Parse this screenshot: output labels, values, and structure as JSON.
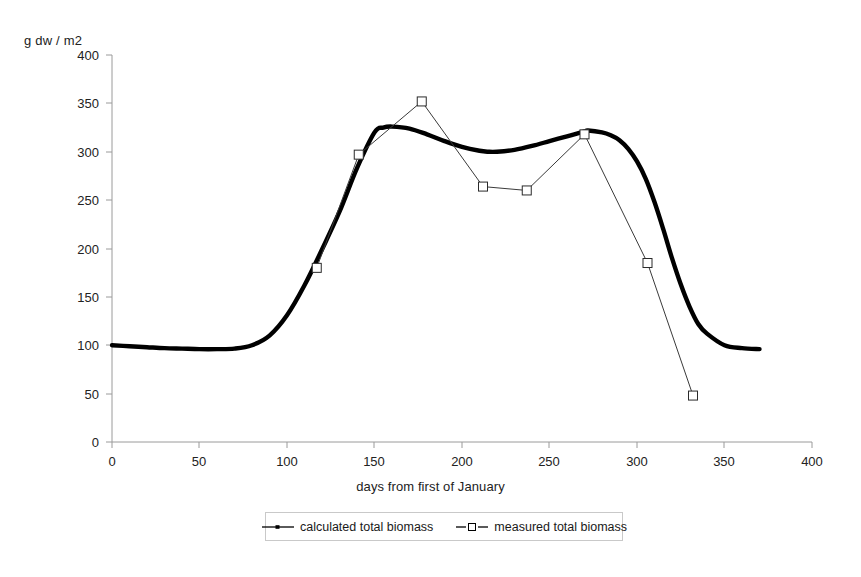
{
  "chart_data": {
    "type": "line",
    "title": "",
    "xlabel": "days from first of January",
    "ylabel": "g dw / m2",
    "xlim": [
      0,
      400
    ],
    "ylim": [
      0,
      400
    ],
    "xticks": [
      0,
      50,
      100,
      150,
      200,
      250,
      300,
      350,
      400
    ],
    "yticks": [
      0,
      50,
      100,
      150,
      200,
      250,
      300,
      350,
      400
    ],
    "grid": false,
    "legend_position": "bottom-center",
    "series": [
      {
        "name": "calculated total biomass",
        "marker": "none",
        "line_style": "thick-solid",
        "color": "#000000",
        "x": [
          0,
          10,
          20,
          30,
          40,
          50,
          60,
          70,
          80,
          90,
          100,
          110,
          120,
          130,
          140,
          150,
          155,
          160,
          170,
          180,
          190,
          200,
          210,
          215,
          220,
          230,
          240,
          250,
          260,
          270,
          272,
          280,
          285,
          290,
          295,
          300,
          305,
          310,
          315,
          320,
          325,
          330,
          335,
          340,
          350,
          360,
          370
        ],
        "y": [
          100,
          99,
          98,
          97,
          96.5,
          96,
          96,
          96.5,
          100,
          110,
          131,
          162,
          199,
          238,
          283,
          320,
          325,
          326,
          324,
          318,
          311,
          305,
          301,
          300,
          300,
          302,
          306,
          311,
          316,
          321,
          322,
          320,
          317,
          312,
          303,
          290,
          272,
          248,
          220,
          190,
          163,
          140,
          122,
          112,
          100,
          97,
          96
        ]
      },
      {
        "name": "measured total biomass",
        "marker": "open-square",
        "line_style": "thin-solid",
        "color": "#000000",
        "x": [
          117,
          141,
          177,
          212,
          237,
          270,
          306,
          332
        ],
        "y": [
          180,
          297,
          352,
          264,
          260,
          318,
          185,
          48
        ]
      }
    ]
  },
  "legend": {
    "entries": [
      {
        "label": "calculated total biomass"
      },
      {
        "label": "measured total biomass"
      }
    ]
  },
  "axes": {
    "y_unit_label": "g dw / m2",
    "x_title": "days from first of January",
    "y_tick_labels": [
      "400",
      "350",
      "300",
      "250",
      "200",
      "150",
      "100",
      "50",
      "0"
    ],
    "x_tick_labels": [
      "0",
      "50",
      "100",
      "150",
      "200",
      "250",
      "300",
      "350",
      "400"
    ]
  },
  "colors": {
    "axis": "#8a8a8a",
    "calculated_line": "#000000",
    "measured_line": "#333333",
    "marker_fill": "#ffffff",
    "legend_border": "#c9c9c9"
  }
}
